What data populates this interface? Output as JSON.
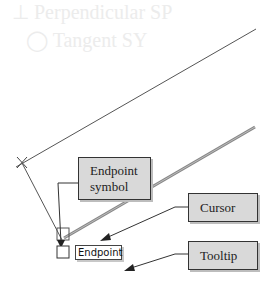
{
  "background_ghost_text": {
    "line1": "⊥   Perpendicular   SP",
    "line2": "◯   Tangent   SY",
    "line3": "mode available",
    "line4": "…"
  },
  "callouts": {
    "endpoint_symbol": {
      "line1": "Endpoint",
      "line2": "symbol"
    },
    "cursor": "Cursor",
    "tooltip": "Tooltip"
  },
  "snap_tooltip": {
    "label": "Endpoint"
  },
  "colors": {
    "callout_fill": "#d9d9d9",
    "callout_border": "#333333",
    "line": "#555555",
    "thick_line": "#777777"
  }
}
